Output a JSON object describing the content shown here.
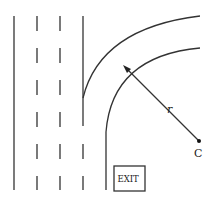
{
  "diagram": {
    "type": "highway-exit-ramp",
    "labels": {
      "radius": "r",
      "center": "C",
      "sign": "EXIT"
    },
    "colors": {
      "stroke": "#333333",
      "background": "#ffffff"
    },
    "geometry": {
      "center": [
        199,
        141
      ],
      "outer_radius": 120,
      "inner_radius": 94,
      "radius_arrow_tip": [
        124,
        66
      ]
    }
  }
}
